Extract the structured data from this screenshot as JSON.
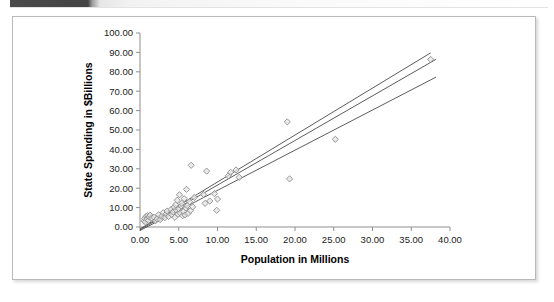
{
  "page": {
    "header_band_color": "#434343",
    "card_border_color": "#b9b9b9",
    "background": "#ffffff"
  },
  "chart_data": {
    "type": "scatter",
    "title": "",
    "xlabel": "Population in Millions",
    "ylabel": "State Spending in $Billions",
    "xlim": [
      0,
      40
    ],
    "ylim": [
      0,
      100
    ],
    "xticks": [
      0,
      5,
      10,
      15,
      20,
      25,
      30,
      35,
      40
    ],
    "xticklabels": [
      "0.00",
      "5.00",
      "10.00",
      "15.00",
      "20.00",
      "25.00",
      "30.00",
      "35.00",
      "40.00"
    ],
    "yticks": [
      0,
      10,
      20,
      30,
      40,
      50,
      60,
      70,
      80,
      90,
      100
    ],
    "yticklabels": [
      "0.00",
      "10.00",
      "20.00",
      "30.00",
      "40.00",
      "50.00",
      "60.00",
      "70.00",
      "80.00",
      "90.00",
      "100.00"
    ],
    "grid": false,
    "legend": false,
    "marker_style": "open-diamond",
    "marker_fill": "#e4e4e4",
    "marker_stroke": "#8d8d8d",
    "points": [
      [
        0.5,
        3.1
      ],
      [
        0.6,
        4.4
      ],
      [
        0.7,
        2.6
      ],
      [
        0.8,
        5.5
      ],
      [
        0.9,
        4.0
      ],
      [
        1.0,
        5.8
      ],
      [
        1.1,
        3.4
      ],
      [
        1.2,
        5.2
      ],
      [
        1.3,
        6.1
      ],
      [
        1.5,
        4.6
      ],
      [
        1.8,
        5.0
      ],
      [
        2.0,
        3.2
      ],
      [
        2.2,
        4.2
      ],
      [
        2.4,
        6.3
      ],
      [
        2.6,
        3.8
      ],
      [
        2.8,
        5.6
      ],
      [
        3.0,
        7.4
      ],
      [
        3.2,
        4.8
      ],
      [
        3.4,
        6.8
      ],
      [
        3.5,
        8.2
      ],
      [
        3.7,
        5.4
      ],
      [
        4.0,
        9.0
      ],
      [
        4.1,
        6.4
      ],
      [
        4.3,
        7.8
      ],
      [
        4.4,
        10.2
      ],
      [
        4.5,
        5.0
      ],
      [
        4.6,
        11.4
      ],
      [
        4.7,
        8.6
      ],
      [
        4.8,
        13.8
      ],
      [
        4.9,
        6.6
      ],
      [
        5.0,
        9.4
      ],
      [
        5.1,
        16.6
      ],
      [
        5.2,
        7.2
      ],
      [
        5.3,
        10.8
      ],
      [
        5.4,
        12.2
      ],
      [
        5.5,
        5.8
      ],
      [
        5.6,
        8.0
      ],
      [
        5.7,
        14.6
      ],
      [
        5.8,
        6.2
      ],
      [
        5.9,
        9.8
      ],
      [
        6.0,
        19.4
      ],
      [
        6.1,
        11.0
      ],
      [
        6.2,
        7.0
      ],
      [
        6.4,
        13.0
      ],
      [
        6.5,
        8.4
      ],
      [
        6.6,
        31.8
      ],
      [
        6.8,
        10.4
      ],
      [
        7.0,
        15.2
      ],
      [
        8.2,
        16.8
      ],
      [
        8.4,
        12.2
      ],
      [
        8.6,
        28.8
      ],
      [
        9.0,
        13.4
      ],
      [
        9.6,
        17.2
      ],
      [
        9.9,
        8.6
      ],
      [
        10.0,
        14.4
      ],
      [
        11.4,
        26.4
      ],
      [
        11.7,
        28.2
      ],
      [
        12.4,
        29.4
      ],
      [
        12.8,
        25.6
      ],
      [
        19.0,
        54.2
      ],
      [
        19.3,
        24.8
      ],
      [
        25.2,
        45.2
      ],
      [
        37.5,
        86.4
      ]
    ],
    "fit_lines": [
      {
        "name": "upper",
        "slope": 2.42,
        "intercept": -1.0,
        "x_start": 0.0,
        "x_end": 37.5
      },
      {
        "name": "center",
        "slope": 2.3,
        "intercept": -1.4,
        "x_start": 0.0,
        "x_end": 38.2
      },
      {
        "name": "lower",
        "slope": 2.07,
        "intercept": -1.8,
        "x_start": 0.0,
        "x_end": 38.2
      }
    ],
    "fit_line_color": "#4a4a4a"
  }
}
